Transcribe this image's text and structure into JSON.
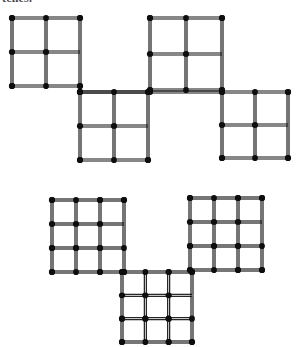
{
  "page": {
    "background_color": "#ffffff",
    "ink_color": "#111111",
    "head_color": "#0d0d0d",
    "width": 304,
    "height": 347,
    "clipped_caption_text": "tches."
  },
  "figures": [
    {
      "id": "figure-top",
      "name": "matchstick-figure-top",
      "description": "Four 2x2 matchstick grid squares arranged in a descending staircase",
      "cell_grid": 2,
      "square_count": 4,
      "squares": [
        {
          "id": "top-square-1",
          "name": "grid-square-upper-left",
          "x": 12,
          "y": 18,
          "size": 68,
          "divisions": 2
        },
        {
          "id": "top-square-2",
          "name": "grid-square-lower-left",
          "x": 80,
          "y": 92,
          "size": 68,
          "divisions": 2
        },
        {
          "id": "top-square-3",
          "name": "grid-square-upper-right",
          "x": 150,
          "y": 18,
          "size": 72,
          "divisions": 2
        },
        {
          "id": "top-square-4",
          "name": "grid-square-lower-right",
          "x": 222,
          "y": 92,
          "size": 66,
          "divisions": 2
        }
      ],
      "connectors": [
        {
          "id": "top-connector-1",
          "name": "connector-left-to-center",
          "x1": 80,
          "y1": 92,
          "x2": 150,
          "y2": 92
        },
        {
          "id": "top-connector-2",
          "name": "connector-center-to-right",
          "x1": 150,
          "y1": 92,
          "x2": 222,
          "y2": 92
        }
      ]
    },
    {
      "id": "figure-bottom",
      "name": "matchstick-figure-bottom",
      "description": "Three 3x3 matchstick grid squares arranged with two upper and one lower center",
      "cell_grid": 3,
      "square_count": 3,
      "squares": [
        {
          "id": "bottom-square-1",
          "name": "grid-square-left",
          "x": 52,
          "y": 200,
          "size": 72,
          "divisions": 3
        },
        {
          "id": "bottom-square-2",
          "name": "grid-square-right",
          "x": 190,
          "y": 198,
          "size": 72,
          "divisions": 3
        },
        {
          "id": "bottom-square-3",
          "name": "grid-square-center",
          "x": 122,
          "y": 272,
          "size": 70,
          "divisions": 3
        }
      ],
      "connectors": [
        {
          "id": "bottom-connector-1",
          "name": "connector-left-to-center",
          "x1": 124,
          "y1": 272,
          "x2": 122,
          "y2": 272
        },
        {
          "id": "bottom-connector-2",
          "name": "connector-center-to-right",
          "x1": 192,
          "y1": 272,
          "x2": 190,
          "y2": 270
        }
      ]
    }
  ]
}
